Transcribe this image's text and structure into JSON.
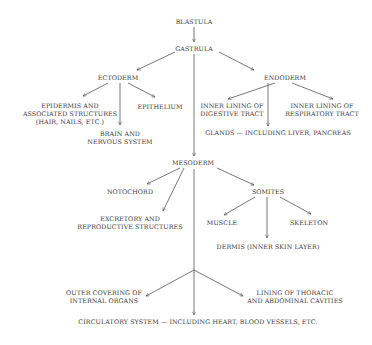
{
  "diagram": {
    "type": "embryonic germ layer derivation tree",
    "nodes": {
      "blastula": {
        "lines": [
          "BLASTULA"
        ]
      },
      "gastrula": {
        "lines": [
          "GASTRULA"
        ]
      },
      "ectoderm": {
        "lines": [
          "ECTODERM"
        ]
      },
      "endoderm": {
        "lines": [
          "ENDODERM"
        ]
      },
      "epidermis": {
        "lines": [
          "EPIDERMIS AND",
          "ASSOCIATED STRUCTURES",
          "(HAIR, NAILS, ETC.)"
        ]
      },
      "epithelium": {
        "lines": [
          "EPITHELIUM"
        ]
      },
      "brain": {
        "lines": [
          "BRAIN AND",
          "NERVOUS SYSTEM"
        ]
      },
      "digestive": {
        "lines": [
          "INNER LINING OF",
          "DIGESTIVE TRACT"
        ]
      },
      "respiratory": {
        "lines": [
          "INNER LINING OF",
          "RESPIRATORY TRACT"
        ]
      },
      "glands": {
        "lines": [
          "GLANDS — INCLUDING LIVER, PANCREAS"
        ]
      },
      "mesoderm": {
        "lines": [
          "MESODERM"
        ]
      },
      "notochord": {
        "lines": [
          "NOTOCHORD"
        ]
      },
      "somites": {
        "lines": [
          "SOMITES"
        ]
      },
      "excretory": {
        "lines": [
          "EXCRETORY AND",
          "REPRODUCTIVE STRUCTURES"
        ]
      },
      "muscle": {
        "lines": [
          "MUSCLE"
        ]
      },
      "skeleton": {
        "lines": [
          "SKELETON"
        ]
      },
      "dermis": {
        "lines": [
          "DERMIS (INNER SKIN LAYER)"
        ]
      },
      "outer_covering": {
        "lines": [
          "OUTER COVERING OF",
          "INTERNAL ORGANS"
        ]
      },
      "lining_cavities": {
        "lines": [
          "LINING OF THORACIC",
          "AND ABDOMINAL CAVITIES"
        ]
      },
      "circulatory": {
        "lines": [
          "CIRCULATORY SYSTEM — INCLUDING HEART, BLOOD VESSELS, ETC."
        ]
      }
    },
    "edges": [
      [
        "blastula",
        "gastrula"
      ],
      [
        "gastrula",
        "ectoderm"
      ],
      [
        "gastrula",
        "endoderm"
      ],
      [
        "gastrula",
        "mesoderm"
      ],
      [
        "ectoderm",
        "epidermis"
      ],
      [
        "ectoderm",
        "epithelium"
      ],
      [
        "ectoderm",
        "brain"
      ],
      [
        "endoderm",
        "digestive"
      ],
      [
        "endoderm",
        "respiratory"
      ],
      [
        "endoderm",
        "glands"
      ],
      [
        "mesoderm",
        "notochord"
      ],
      [
        "mesoderm",
        "excretory"
      ],
      [
        "mesoderm",
        "somites"
      ],
      [
        "mesoderm",
        "outer_covering"
      ],
      [
        "mesoderm",
        "lining_cavities"
      ],
      [
        "mesoderm",
        "circulatory"
      ],
      [
        "somites",
        "muscle"
      ],
      [
        "somites",
        "skeleton"
      ],
      [
        "somites",
        "dermis"
      ]
    ],
    "colors": {
      "text": "#3a3a3a",
      "lines": "#555555",
      "background": "#ffffff"
    }
  }
}
